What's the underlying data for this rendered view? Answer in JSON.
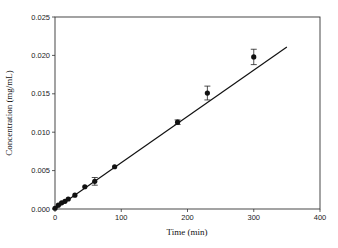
{
  "chart_data": {
    "type": "scatter",
    "title": "",
    "xlabel": "Time (min)",
    "ylabel": "Concentration (mg/mL)",
    "xlim": [
      0,
      400
    ],
    "ylim": [
      0,
      0.025
    ],
    "xticks": [
      "0",
      "100",
      "200",
      "300",
      "400"
    ],
    "yticks": [
      "0.000",
      "0.005",
      "0.010",
      "0.015",
      "0.020",
      "0.025"
    ],
    "grid": false,
    "legend": null,
    "series": [
      {
        "name": "Measured concentration",
        "kind": "points-with-error-bars",
        "x": [
          0,
          5,
          10,
          15,
          20,
          30,
          45,
          60,
          90,
          185,
          230,
          300
        ],
        "y": [
          0.0001,
          0.0005,
          0.0008,
          0.001,
          0.0013,
          0.0018,
          0.0029,
          0.0036,
          0.0055,
          0.0113,
          0.0151,
          0.0198
        ],
        "error": [
          0.0001,
          0.0001,
          0.0001,
          0.0001,
          0.0001,
          0.0002,
          0.0002,
          0.0005,
          0.0002,
          0.0003,
          0.0009,
          0.001
        ]
      },
      {
        "name": "Linear fit",
        "kind": "line",
        "x": [
          0,
          350
        ],
        "y": [
          0.0,
          0.0211
        ]
      }
    ]
  }
}
